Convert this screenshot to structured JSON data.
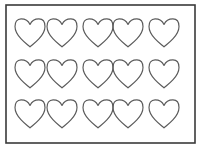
{
  "document": {
    "title": "Heart Shapes Template Sheet",
    "kind": "printable-worksheet",
    "background_color": "#ffffff",
    "canvas": {
      "width": 201,
      "height": 149
    }
  },
  "border": {
    "name": "page-border",
    "color": "#3a3a3a",
    "stroke_width": 1.6,
    "x": 6,
    "y": 5,
    "width": 189,
    "height": 138
  },
  "shape": {
    "name": "heart",
    "icon": "heart-outline-icon",
    "outline_color": "#5a5a5a",
    "fill_color": "none",
    "stroke_width": 1.15,
    "width": 30,
    "height": 28
  },
  "grid": {
    "rows": 3,
    "columns": 5,
    "total_count": 15,
    "column_centers": [
      30,
      62,
      98,
      128,
      164
    ],
    "row_centers": [
      33,
      74,
      114
    ]
  },
  "hearts": [
    {
      "id": 1,
      "row": 1,
      "column": 1,
      "cx": 30,
      "cy": 33
    },
    {
      "id": 2,
      "row": 1,
      "column": 2,
      "cx": 62,
      "cy": 33
    },
    {
      "id": 3,
      "row": 1,
      "column": 3,
      "cx": 98,
      "cy": 33
    },
    {
      "id": 4,
      "row": 1,
      "column": 4,
      "cx": 128,
      "cy": 33
    },
    {
      "id": 5,
      "row": 1,
      "column": 5,
      "cx": 164,
      "cy": 33
    },
    {
      "id": 6,
      "row": 2,
      "column": 1,
      "cx": 30,
      "cy": 74
    },
    {
      "id": 7,
      "row": 2,
      "column": 2,
      "cx": 62,
      "cy": 74
    },
    {
      "id": 8,
      "row": 2,
      "column": 3,
      "cx": 98,
      "cy": 74
    },
    {
      "id": 9,
      "row": 2,
      "column": 4,
      "cx": 128,
      "cy": 74
    },
    {
      "id": 10,
      "row": 2,
      "column": 5,
      "cx": 164,
      "cy": 74
    },
    {
      "id": 11,
      "row": 3,
      "column": 1,
      "cx": 30,
      "cy": 114
    },
    {
      "id": 12,
      "row": 3,
      "column": 2,
      "cx": 62,
      "cy": 114
    },
    {
      "id": 13,
      "row": 3,
      "column": 3,
      "cx": 98,
      "cy": 114
    },
    {
      "id": 14,
      "row": 3,
      "column": 4,
      "cx": 128,
      "cy": 114
    },
    {
      "id": 15,
      "row": 3,
      "column": 5,
      "cx": 164,
      "cy": 114
    }
  ]
}
